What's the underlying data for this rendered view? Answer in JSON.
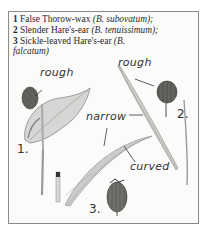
{
  "caption": {
    "lines": [
      {
        "num": "1",
        "common": "False Thorow-wax",
        "latin": "(B. subovatum);"
      },
      {
        "num": "2",
        "common": "Slender Hare's-ear",
        "latin": "(B. tenuissimum);"
      },
      {
        "num": "3",
        "common": "Sickle-leaved Hare's-ear",
        "latin": "(B.",
        "latin_cont": "falcatum)"
      }
    ]
  },
  "labels": {
    "rough_1": "rough",
    "rough_2": "rough",
    "narrow": "narrow",
    "curved": "curved"
  },
  "figure_numbers": {
    "one": "1.",
    "two": "2.",
    "three": "3."
  },
  "colors": {
    "frame_border": "#8a8a8a",
    "ink": "#2a2a2a",
    "leaf_light": "#d8d8d6",
    "leaf_dark": "#8c8c8a",
    "seed_head": "#5e5e5a"
  }
}
